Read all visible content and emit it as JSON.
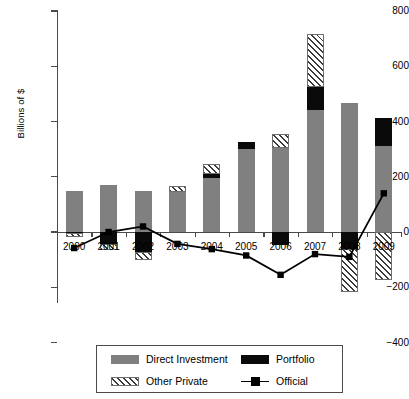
{
  "chart_data": {
    "type": "bar",
    "title": "",
    "subtitle": "",
    "xlabel": "",
    "ylabel": "Billions of $",
    "ylim": [
      -400,
      800
    ],
    "yticks": [
      -400,
      -200,
      0,
      200,
      400,
      600,
      800
    ],
    "ytick_labels": [
      "−400",
      "−200",
      "0",
      "200",
      "400",
      "600",
      "800"
    ],
    "grid": false,
    "legend_position": "bottom",
    "stacked": true,
    "categories": [
      "2000",
      "2001",
      "2002",
      "2003",
      "2004",
      "2005",
      "2006",
      "2007",
      "2008",
      "2009"
    ],
    "series": [
      {
        "name": "Direct Investment",
        "type": "bar",
        "color": "#808080",
        "values": [
          148,
          170,
          149,
          145,
          195,
          300,
          305,
          440,
          468,
          312
        ]
      },
      {
        "name": "Portfolio",
        "type": "bar",
        "color": "#0a0a0a",
        "values": [
          -5,
          -42,
          -72,
          0,
          15,
          25,
          -48,
          85,
          -62,
          102
        ]
      },
      {
        "name": "Other Private",
        "type": "bar",
        "color": "#ffffff",
        "pattern": "diagonal-hatch",
        "values": [
          -12,
          -23,
          -30,
          20,
          37,
          0,
          50,
          190,
          -155,
          -175
        ]
      },
      {
        "name": "Official",
        "type": "line",
        "color": "#000000",
        "marker": "square",
        "values": [
          -58,
          0,
          20,
          -43,
          -62,
          -85,
          -155,
          -80,
          -90,
          140
        ]
      }
    ],
    "legend": [
      {
        "label": "Direct Investment",
        "swatch": "direct-investment-swatch"
      },
      {
        "label": "Portfolio",
        "swatch": "portfolio-swatch"
      },
      {
        "label": "Other Private",
        "swatch": "other-private-swatch"
      },
      {
        "label": "Official",
        "swatch": "official-line-swatch"
      }
    ]
  }
}
